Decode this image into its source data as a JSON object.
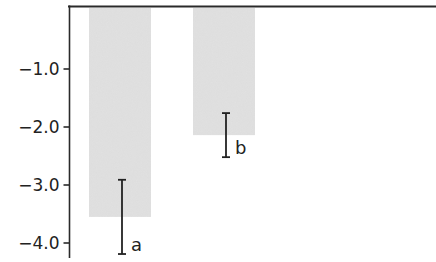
{
  "chart_data": {
    "type": "bar",
    "title": "",
    "xlabel": "",
    "ylabel": "",
    "categories": [
      "a",
      "b"
    ],
    "values": [
      -3.55,
      -2.14
    ],
    "error_bars": [
      {
        "low": -4.19,
        "high": -2.91
      },
      {
        "low": -2.52,
        "high": -1.76
      }
    ],
    "annotations": [
      "a",
      "b"
    ],
    "yticks": [
      -1.0,
      -2.0,
      -3.0,
      -4.0
    ],
    "ytick_labels": [
      "−1.0",
      "−2.0",
      "−3.0",
      "−4.0"
    ],
    "ylim": [
      -4.2,
      0.1
    ],
    "grid": false,
    "legend": null,
    "colors": {
      "bar": "#e2e2e2",
      "axis": "#2a2a2a",
      "error_bar": "#222222",
      "text": "#222222"
    }
  }
}
